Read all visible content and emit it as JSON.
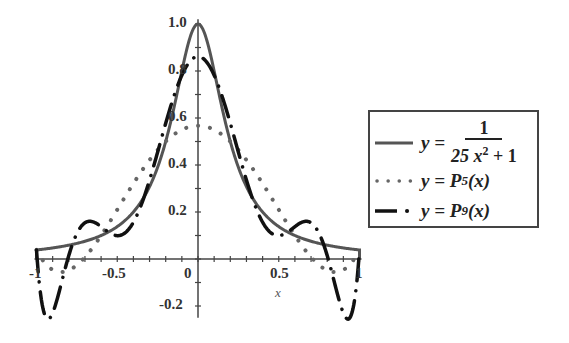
{
  "chart_data": {
    "type": "line",
    "title": "",
    "xlabel": "x",
    "ylabel": "",
    "xlim": [
      -1,
      1
    ],
    "ylim": [
      -0.25,
      1.0
    ],
    "grid": false,
    "legend_position": "right",
    "x_ticks": [
      "-1",
      "-0.5",
      "0",
      "0.5",
      "1"
    ],
    "x_tick_values": [
      -1,
      -0.5,
      0,
      0.5,
      1
    ],
    "y_ticks": [
      "-0.2",
      "0.2",
      "0.4",
      "0.6",
      "0.8",
      "1.0"
    ],
    "y_tick_values": [
      -0.2,
      0.2,
      0.4,
      0.6,
      0.8,
      1.0
    ],
    "series": [
      {
        "name": "y = 1/(25x^2+1)",
        "style": "solid",
        "color": "#555555",
        "function": "runge",
        "peak": 1.0,
        "endpoint_value": 0.0385
      },
      {
        "name": "y = P5(x)",
        "style": "dotted",
        "color": "#555555",
        "degree": 5,
        "peak": 0.567,
        "interpolation_nodes": [
          -1,
          -0.6,
          -0.2,
          0.2,
          0.6,
          1
        ]
      },
      {
        "name": "y = P9(x)",
        "style": "dashed",
        "color": "#111111",
        "degree": 9,
        "peak": 0.84,
        "min": -0.26,
        "interpolation_nodes": [
          -1,
          -0.7778,
          -0.5556,
          -0.3333,
          -0.1111,
          0.1111,
          0.3333,
          0.5556,
          0.7778,
          1
        ]
      }
    ]
  },
  "legend": {
    "entries": [
      {
        "prefix": "y =",
        "numerator": "1",
        "denominator_base": "25 x",
        "denominator_exp": "2",
        "denominator_tail": "+ 1"
      },
      {
        "prefix": "y =",
        "func": "P",
        "sub": "5",
        "arg": "(x)"
      },
      {
        "prefix": "y =",
        "func": "P",
        "sub": "9",
        "arg": "(x)"
      }
    ]
  },
  "axis_labels": {
    "x": "x"
  },
  "tick_labels": {
    "x": [
      "-1",
      "-0.5",
      "0",
      "0.5",
      "1"
    ],
    "y": [
      "1.0",
      "0.8",
      "0.6",
      "0.4",
      "0.2",
      "-0.2"
    ]
  }
}
